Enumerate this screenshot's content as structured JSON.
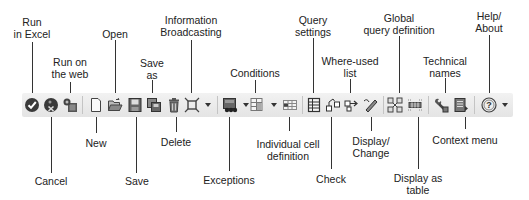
{
  "toolbar": {
    "buttons": [
      {
        "id": "run-in-excel",
        "label_lines": [
          "Run",
          "in Excel"
        ],
        "icon": "checkmark-circle-icon"
      },
      {
        "id": "cancel",
        "label_lines": [
          "Cancel"
        ],
        "icon": "cancel-circle-icon"
      },
      {
        "id": "run-on-web",
        "label_lines": [
          "Run on",
          "the web"
        ],
        "icon": "web-run-icon"
      },
      {
        "id": "new",
        "label_lines": [
          "New"
        ],
        "icon": "new-document-icon"
      },
      {
        "id": "open",
        "label_lines": [
          "Open"
        ],
        "icon": "open-folder-icon"
      },
      {
        "id": "save",
        "label_lines": [
          "Save"
        ],
        "icon": "save-disk-icon"
      },
      {
        "id": "save-as",
        "label_lines": [
          "Save",
          "as"
        ],
        "icon": "save-as-icon"
      },
      {
        "id": "delete",
        "label_lines": [
          "Delete"
        ],
        "icon": "trash-icon"
      },
      {
        "id": "information-broadcasting",
        "label_lines": [
          "Information",
          "Broadcasting"
        ],
        "icon": "broadcast-icon"
      },
      {
        "id": "exceptions",
        "label_lines": [
          "Exceptions"
        ],
        "icon": "exceptions-icon"
      },
      {
        "id": "conditions",
        "label_lines": [
          "Conditions"
        ],
        "icon": "conditions-icon"
      },
      {
        "id": "individual-cell-definition",
        "label_lines": [
          "Individual cell",
          "definition"
        ],
        "icon": "cell-grid-icon"
      },
      {
        "id": "query-settings",
        "label_lines": [
          "Query",
          "settings"
        ],
        "icon": "query-settings-icon"
      },
      {
        "id": "check",
        "label_lines": [
          "Check"
        ],
        "icon": "check-hierarchy-icon"
      },
      {
        "id": "where-used-list",
        "label_lines": [
          "Where-used",
          "list"
        ],
        "icon": "where-used-icon"
      },
      {
        "id": "display-change",
        "label_lines": [
          "Display/",
          "Change"
        ],
        "icon": "pencil-icon"
      },
      {
        "id": "global-query-definition",
        "label_lines": [
          "Global",
          "query definition"
        ],
        "icon": "global-query-icon"
      },
      {
        "id": "display-as-table",
        "label_lines": [
          "Display as",
          "table"
        ],
        "icon": "table-view-icon"
      },
      {
        "id": "technical-names",
        "label_lines": [
          "Technical",
          "names"
        ],
        "icon": "wrench-icon"
      },
      {
        "id": "context-menu",
        "label_lines": [
          "Context menu"
        ],
        "icon": "context-menu-icon"
      },
      {
        "id": "help-about",
        "label_lines": [
          "Help/",
          "About"
        ],
        "icon": "help-icon"
      }
    ]
  },
  "labels": {
    "run_in_excel": [
      "Run",
      "in Excel"
    ],
    "cancel": [
      "Cancel"
    ],
    "run_on_web": [
      "Run on",
      "the web"
    ],
    "new": [
      "New"
    ],
    "open": [
      "Open"
    ],
    "save": [
      "Save"
    ],
    "save_as": [
      "Save",
      "as"
    ],
    "delete": [
      "Delete"
    ],
    "information_broadcasting": [
      "Information",
      "Broadcasting"
    ],
    "exceptions": [
      "Exceptions"
    ],
    "conditions": [
      "Conditions"
    ],
    "individual_cell_definition": [
      "Individual cell",
      "definition"
    ],
    "query_settings": [
      "Query",
      "settings"
    ],
    "check": [
      "Check"
    ],
    "where_used_list": [
      "Where-used",
      "list"
    ],
    "display_change": [
      "Display/",
      "Change"
    ],
    "global_query_definition": [
      "Global",
      "query definition"
    ],
    "display_as_table": [
      "Display as",
      "table"
    ],
    "technical_names": [
      "Technical",
      "names"
    ],
    "context_menu": [
      "Context menu"
    ],
    "help_about": [
      "Help/",
      "About"
    ]
  },
  "colors": {
    "toolbar_bg": "#e9e9e9",
    "icon_dark": "#333333",
    "icon_mid": "#777777",
    "label_text": "#222222",
    "leader_line": "#333333"
  }
}
